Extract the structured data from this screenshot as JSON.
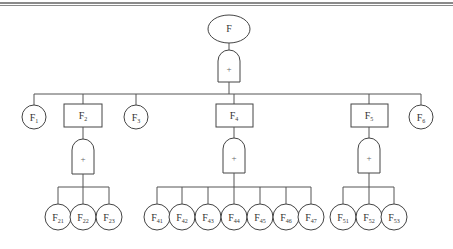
{
  "diagram": {
    "type": "fault-tree",
    "colors": {
      "line": "#555555",
      "border_rule": "#8a8a8a",
      "background": "#ffffff"
    },
    "top_event": {
      "id": "F",
      "label": "F",
      "shape": "ellipse"
    },
    "top_gate": {
      "symbol": "+",
      "type": "OR"
    },
    "level1": [
      {
        "id": "F1",
        "base": "F",
        "sub": "1",
        "shape": "circle"
      },
      {
        "id": "F2",
        "base": "F",
        "sub": "2",
        "shape": "rectangle",
        "gate": "+"
      },
      {
        "id": "F3",
        "base": "F",
        "sub": "3",
        "shape": "circle"
      },
      {
        "id": "F4",
        "base": "F",
        "sub": "4",
        "shape": "rectangle",
        "gate": "+"
      },
      {
        "id": "F5",
        "base": "F",
        "sub": "5",
        "shape": "rectangle",
        "gate": "+"
      },
      {
        "id": "F6",
        "base": "F",
        "sub": "6",
        "shape": "circle"
      }
    ],
    "children": {
      "F2": [
        {
          "base": "F",
          "sub": "21"
        },
        {
          "base": "F",
          "sub": "22"
        },
        {
          "base": "F",
          "sub": "23"
        }
      ],
      "F4": [
        {
          "base": "F",
          "sub": "41"
        },
        {
          "base": "F",
          "sub": "42"
        },
        {
          "base": "F",
          "sub": "43"
        },
        {
          "base": "F",
          "sub": "44"
        },
        {
          "base": "F",
          "sub": "45"
        },
        {
          "base": "F",
          "sub": "46"
        },
        {
          "base": "F",
          "sub": "47"
        }
      ],
      "F5": [
        {
          "base": "F",
          "sub": "51"
        },
        {
          "base": "F",
          "sub": "52"
        },
        {
          "base": "F",
          "sub": "53"
        }
      ]
    }
  }
}
